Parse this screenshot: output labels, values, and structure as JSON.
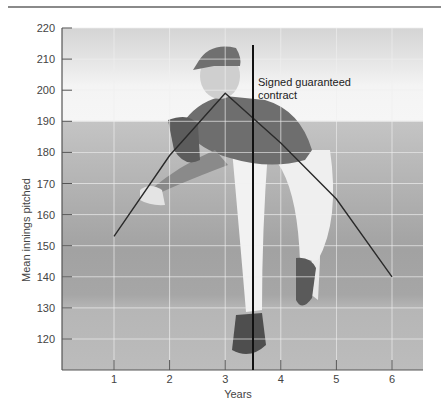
{
  "chart_data": {
    "type": "line",
    "title": "",
    "xlabel": "Years",
    "ylabel": "Mean innings pitched",
    "x": [
      1,
      2,
      3,
      4,
      5,
      6
    ],
    "categories": [
      "1",
      "2",
      "3",
      "4",
      "5",
      "6"
    ],
    "series": [
      {
        "name": "Mean innings pitched",
        "values": [
          153,
          179,
          199,
          183,
          165,
          140
        ]
      }
    ],
    "xlim": [
      0,
      6.55
    ],
    "ylim": [
      110,
      220
    ],
    "x_ticks": [
      1,
      2,
      3,
      4,
      5,
      6
    ],
    "y_ticks": [
      120,
      130,
      140,
      150,
      160,
      170,
      180,
      190,
      200,
      210,
      220
    ],
    "grid": true,
    "legend": "none",
    "annotations": [
      {
        "type": "vertical-line",
        "x": 3.5,
        "label": "Signed guaranteed contract"
      }
    ],
    "background": "photograph of a baseball pitcher mid-delivery (grayscale)"
  },
  "axes": {
    "xlabel": "Years",
    "ylabel": "Mean innings pitched"
  },
  "annotation": {
    "line1": "Signed guaranteed",
    "line2": "contract"
  },
  "colors": {
    "line": "#2a2a2a",
    "contract_line": "#111111",
    "gridline": "#f0f0f0",
    "axis": "#555555"
  }
}
